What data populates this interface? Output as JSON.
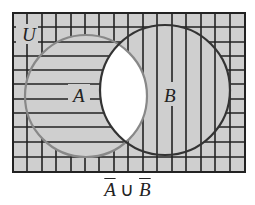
{
  "diagram": {
    "type": "venn",
    "universe_label": "U",
    "set_a_label": "A",
    "set_b_label": "B",
    "caption": {
      "a": "A",
      "union": "∪",
      "b": "B"
    },
    "shaded_region": "complement of A ∩ B",
    "colors": {
      "fill": "#cfcfcf",
      "line": "#222222",
      "circle_a": "#888888",
      "circle_b": "#333333",
      "intersection": "#ffffff"
    }
  }
}
